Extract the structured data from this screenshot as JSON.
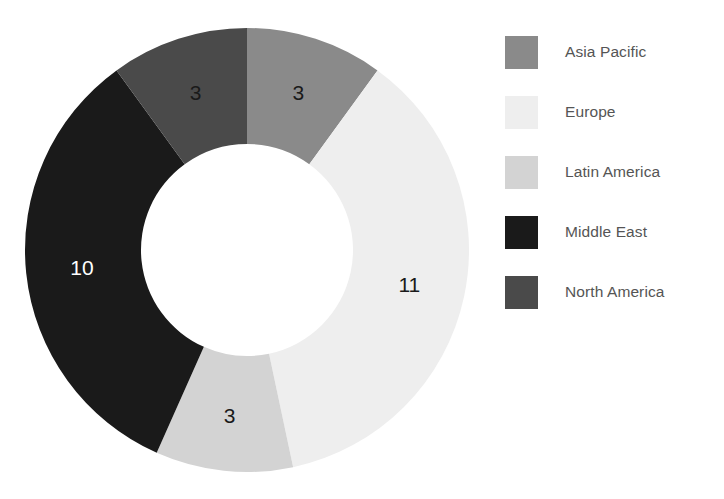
{
  "chart_data": {
    "type": "pie",
    "variant": "donut",
    "title": "",
    "subtitle": "",
    "xlabel": "",
    "ylabel": "",
    "total": 30,
    "units": "count",
    "start_angle_deg": 0,
    "direction": "clockwise",
    "inner_radius_ratio": 0.48,
    "grid": false,
    "legend_position": "right",
    "categories": [
      "Asia Pacific",
      "Europe",
      "Latin America",
      "Middle East",
      "North America"
    ],
    "values": [
      3,
      11,
      3,
      10,
      3
    ],
    "colors": [
      "#8a8a8a",
      "#eeeeee",
      "#d3d3d3",
      "#1a1a1a",
      "#4a4a4a"
    ],
    "label_colors": [
      "#1a1a1a",
      "#1a1a1a",
      "#1a1a1a",
      "#ffffff",
      "#1a1a1a"
    ],
    "slices": [
      {
        "name": "Asia Pacific",
        "value": 3,
        "label": "3",
        "color": "#8a8a8a",
        "label_color": "#1a1a1a",
        "start_deg": 0,
        "end_deg": 36,
        "percent": 10.0
      },
      {
        "name": "Europe",
        "value": 11,
        "label": "11",
        "color": "#eeeeee",
        "label_color": "#1a1a1a",
        "start_deg": 36,
        "end_deg": 168,
        "percent": 36.7
      },
      {
        "name": "Latin America",
        "value": 3,
        "label": "3",
        "color": "#d3d3d3",
        "label_color": "#1a1a1a",
        "start_deg": 168,
        "end_deg": 204,
        "percent": 10.0
      },
      {
        "name": "Middle East",
        "value": 10,
        "label": "10",
        "color": "#1a1a1a",
        "label_color": "#ffffff",
        "start_deg": 204,
        "end_deg": 324,
        "percent": 33.3
      },
      {
        "name": "North America",
        "value": 3,
        "label": "3",
        "color": "#4a4a4a",
        "label_color": "#1a1a1a",
        "start_deg": 324,
        "end_deg": 360,
        "percent": 10.0
      }
    ]
  },
  "legend": {
    "items": [
      {
        "label": "Asia Pacific",
        "color": "#8a8a8a"
      },
      {
        "label": "Europe",
        "color": "#eeeeee"
      },
      {
        "label": "Latin America",
        "color": "#d3d3d3"
      },
      {
        "label": "Middle East",
        "color": "#1a1a1a"
      },
      {
        "label": "North America",
        "color": "#4a4a4a"
      }
    ]
  },
  "geometry": {
    "center_x": 247,
    "center_y": 250,
    "outer_radius": 222,
    "inner_radius": 106,
    "label_radius": 166
  }
}
